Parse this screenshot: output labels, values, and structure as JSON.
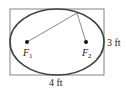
{
  "diagram": {
    "type": "ellipse-in-rectangle",
    "rectangle": {
      "width_label": "4 ft",
      "height_label": "3 ft"
    },
    "foci": [
      {
        "name": "F",
        "subscript": "1"
      },
      {
        "name": "F",
        "subscript": "2"
      }
    ],
    "colors": {
      "stroke": "#555555",
      "ellipse": "#444444",
      "text": "#222222"
    }
  }
}
